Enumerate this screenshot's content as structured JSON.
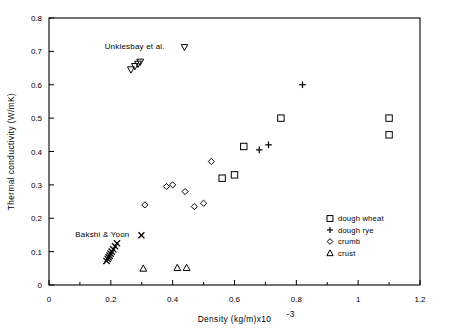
{
  "chart_data": {
    "type": "scatter",
    "title": "",
    "xlabel": "Density (kg/m)x10",
    "xlabel_exponent": "-3",
    "ylabel": "Thermal conductivity (W/mK)",
    "xlim": [
      0,
      1.2
    ],
    "ylim": [
      0,
      0.8
    ],
    "xticks": [
      "0",
      "0.2",
      "0.4",
      "0.6",
      "0.8",
      "1",
      "1.2"
    ],
    "xtick_values": [
      0,
      0.2,
      0.4,
      0.6,
      0.8,
      1,
      1.2
    ],
    "xminor_step": 0.1,
    "yticks": [
      "0",
      "0.1",
      "0.2",
      "0.3",
      "0.4",
      "0.5",
      "0.6",
      "0.7",
      "0.8"
    ],
    "ytick_values": [
      0,
      0.1,
      0.2,
      0.3,
      0.4,
      0.5,
      0.6,
      0.7,
      0.8
    ],
    "grid": false,
    "legend_position": "lower-right",
    "axis_color": "#000000",
    "marker_color": "#000000",
    "series": [
      {
        "name": "dough wheat",
        "marker": "square",
        "points": [
          {
            "x": 0.56,
            "y": 0.32
          },
          {
            "x": 0.6,
            "y": 0.33
          },
          {
            "x": 0.63,
            "y": 0.415
          },
          {
            "x": 0.75,
            "y": 0.5
          },
          {
            "x": 1.1,
            "y": 0.5
          },
          {
            "x": 1.1,
            "y": 0.45
          }
        ]
      },
      {
        "name": "dough rye",
        "marker": "plus",
        "points": [
          {
            "x": 0.68,
            "y": 0.405
          },
          {
            "x": 0.71,
            "y": 0.42
          },
          {
            "x": 0.82,
            "y": 0.6
          }
        ]
      },
      {
        "name": "crumb",
        "marker": "diamond",
        "points": [
          {
            "x": 0.31,
            "y": 0.24
          },
          {
            "x": 0.38,
            "y": 0.295
          },
          {
            "x": 0.4,
            "y": 0.3
          },
          {
            "x": 0.44,
            "y": 0.28
          },
          {
            "x": 0.47,
            "y": 0.235
          },
          {
            "x": 0.5,
            "y": 0.245
          },
          {
            "x": 0.525,
            "y": 0.37
          }
        ]
      },
      {
        "name": "crust",
        "marker": "triangle",
        "points": [
          {
            "x": 0.305,
            "y": 0.05
          },
          {
            "x": 0.415,
            "y": 0.052
          },
          {
            "x": 0.445,
            "y": 0.052
          }
        ]
      },
      {
        "name": "Unklesbay et al.",
        "marker": "down-triangle",
        "annotated": true,
        "points": [
          {
            "x": 0.265,
            "y": 0.645
          },
          {
            "x": 0.278,
            "y": 0.655
          },
          {
            "x": 0.288,
            "y": 0.662
          },
          {
            "x": 0.295,
            "y": 0.668
          }
        ]
      },
      {
        "name": "Bakshi & Yoon",
        "marker": "cross",
        "annotated": true,
        "points": [
          {
            "x": 0.186,
            "y": 0.072
          },
          {
            "x": 0.19,
            "y": 0.078
          },
          {
            "x": 0.193,
            "y": 0.083
          },
          {
            "x": 0.196,
            "y": 0.088
          },
          {
            "x": 0.199,
            "y": 0.094
          },
          {
            "x": 0.203,
            "y": 0.1
          },
          {
            "x": 0.208,
            "y": 0.107
          },
          {
            "x": 0.214,
            "y": 0.116
          },
          {
            "x": 0.22,
            "y": 0.125
          }
        ]
      }
    ],
    "annotations": [
      {
        "text": "Unklesbay et al.",
        "marker": "down-triangle",
        "x": 0.18,
        "y": 0.715
      },
      {
        "text": "Bakshi & Yoon",
        "marker": "cross",
        "x": 0.085,
        "y": 0.152
      }
    ],
    "legend_entries": [
      {
        "label": "dough wheat",
        "marker": "square"
      },
      {
        "label": "dough rye",
        "marker": "plus"
      },
      {
        "label": "crumb",
        "marker": "diamond"
      },
      {
        "label": "crust",
        "marker": "triangle"
      }
    ]
  }
}
